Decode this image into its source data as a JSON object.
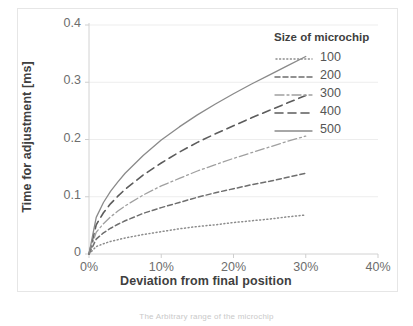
{
  "chart_data": {
    "type": "line",
    "title": "",
    "xlabel": "Deviation from final position",
    "ylabel": "Time for adjustment [ms]",
    "xlim": [
      0,
      40
    ],
    "ylim": [
      0,
      0.4
    ],
    "xticks": [
      "0%",
      "10%",
      "20%",
      "30%",
      "40%"
    ],
    "xtick_values": [
      0,
      10,
      20,
      30,
      40
    ],
    "yticks": [
      "0",
      "0.1",
      "0.2",
      "0.3",
      "0.4"
    ],
    "ytick_values": [
      0,
      0.1,
      0.2,
      0.3,
      0.4
    ],
    "grid": true,
    "grid_axis": "y",
    "legend_position": "top-right",
    "legend_title": "Size of microchip",
    "x": [
      0,
      1,
      2,
      3,
      4,
      5,
      7.5,
      10,
      12.5,
      15,
      17.5,
      20,
      22.5,
      25,
      27.5,
      30
    ],
    "series": [
      {
        "name": "100",
        "style": "dotted",
        "color": "#8c8c8c",
        "values": [
          0,
          0.013,
          0.018,
          0.022,
          0.025,
          0.028,
          0.034,
          0.039,
          0.044,
          0.048,
          0.051,
          0.055,
          0.058,
          0.061,
          0.065,
          0.068
        ]
      },
      {
        "name": "200",
        "style": "dashed",
        "color": "#6e6e6e",
        "values": [
          0,
          0.026,
          0.037,
          0.045,
          0.052,
          0.058,
          0.071,
          0.081,
          0.09,
          0.099,
          0.107,
          0.114,
          0.121,
          0.127,
          0.134,
          0.141
        ]
      },
      {
        "name": "300",
        "style": "dashdot",
        "color": "#a0a0a0",
        "values": [
          0,
          0.038,
          0.053,
          0.065,
          0.075,
          0.084,
          0.103,
          0.119,
          0.132,
          0.145,
          0.156,
          0.167,
          0.177,
          0.187,
          0.197,
          0.206
        ]
      },
      {
        "name": "400",
        "style": "longdash",
        "color": "#5c5c5c",
        "values": [
          0,
          0.051,
          0.072,
          0.088,
          0.101,
          0.113,
          0.138,
          0.159,
          0.178,
          0.195,
          0.21,
          0.224,
          0.238,
          0.251,
          0.264,
          0.277
        ]
      },
      {
        "name": "500",
        "style": "solid",
        "color": "#8a8a8a",
        "values": [
          0,
          0.064,
          0.09,
          0.11,
          0.126,
          0.141,
          0.172,
          0.199,
          0.222,
          0.243,
          0.262,
          0.28,
          0.297,
          0.313,
          0.329,
          0.345
        ]
      }
    ]
  },
  "caption": "The Arbitrary range of the microchip"
}
